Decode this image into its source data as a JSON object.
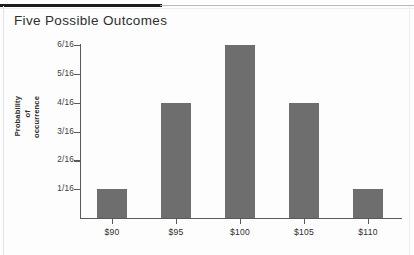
{
  "document": {
    "title": "Five Possible Outcomes"
  },
  "chart_data": {
    "type": "bar",
    "title": "Five Possible Outcomes",
    "xlabel": "",
    "ylabel": "Probability of occurrence",
    "ylabel_lines": [
      "Probability",
      "of",
      "occurrence"
    ],
    "categories": [
      "$90",
      "$95",
      "$100",
      "$105",
      "$110"
    ],
    "values": [
      0.0625,
      0.25,
      0.375,
      0.25,
      0.0625
    ],
    "value_labels": [
      "1/16",
      "4/16",
      "6/16",
      "4/16",
      "1/16"
    ],
    "ytick_labels": [
      "1/16",
      "2/16",
      "3/16",
      "4/16",
      "5/16",
      "6/16"
    ],
    "ytick_values": [
      0.0625,
      0.125,
      0.1875,
      0.25,
      0.3125,
      0.375
    ],
    "ylim": [
      0,
      0.375
    ],
    "grid": false,
    "legend": false,
    "bar_color": "#6e6e6e",
    "axis_color": "#5a5a5a"
  }
}
